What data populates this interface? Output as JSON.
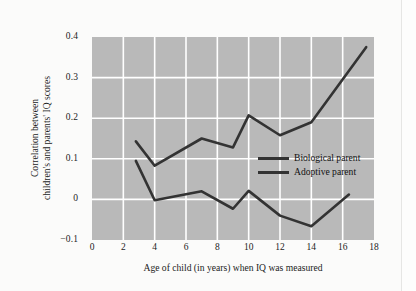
{
  "chart_data": {
    "type": "line",
    "title": "",
    "xlabel": "Age of child (in years) when IQ was measured",
    "ylabel_lines": [
      "Correlation between",
      "children's and parents' IQ scores"
    ],
    "xlim": [
      0,
      18
    ],
    "ylim": [
      -0.1,
      0.4
    ],
    "xticks": [
      0,
      2,
      4,
      6,
      8,
      10,
      12,
      14,
      16,
      18
    ],
    "xtick_labels": [
      "0",
      "2",
      "4",
      "6",
      "8",
      "10",
      "12",
      "14",
      "16",
      "18"
    ],
    "yticks": [
      -0.1,
      0,
      0.1,
      0.2,
      0.3,
      0.4
    ],
    "ytick_labels": [
      "−0.1",
      "0",
      "0.1",
      "0.2",
      "0.3",
      "0.4"
    ],
    "grid": true,
    "grid_color": "#ffffff",
    "plot_background": "#b9b9b9",
    "figure_background": "#fbfbfa",
    "legend_position": "center-right inside plot",
    "series": [
      {
        "name": "Biological parent",
        "color": "#333333",
        "points": [
          {
            "x": 2.8,
            "y": 0.143
          },
          {
            "x": 4.0,
            "y": 0.083
          },
          {
            "x": 7.0,
            "y": 0.15
          },
          {
            "x": 9.0,
            "y": 0.128
          },
          {
            "x": 10.0,
            "y": 0.207
          },
          {
            "x": 12.0,
            "y": 0.158
          },
          {
            "x": 14.0,
            "y": 0.19
          },
          {
            "x": 17.5,
            "y": 0.375
          }
        ]
      },
      {
        "name": "Adoptive parent",
        "color": "#333333",
        "points": [
          {
            "x": 2.8,
            "y": 0.095
          },
          {
            "x": 4.0,
            "y": -0.002
          },
          {
            "x": 7.0,
            "y": 0.02
          },
          {
            "x": 9.0,
            "y": -0.023
          },
          {
            "x": 10.0,
            "y": 0.021
          },
          {
            "x": 12.0,
            "y": -0.04
          },
          {
            "x": 14.0,
            "y": -0.066
          },
          {
            "x": 16.4,
            "y": 0.012
          }
        ]
      }
    ]
  },
  "legend": {
    "items": [
      {
        "label": "Biological parent"
      },
      {
        "label": "Adoptive parent"
      }
    ]
  }
}
